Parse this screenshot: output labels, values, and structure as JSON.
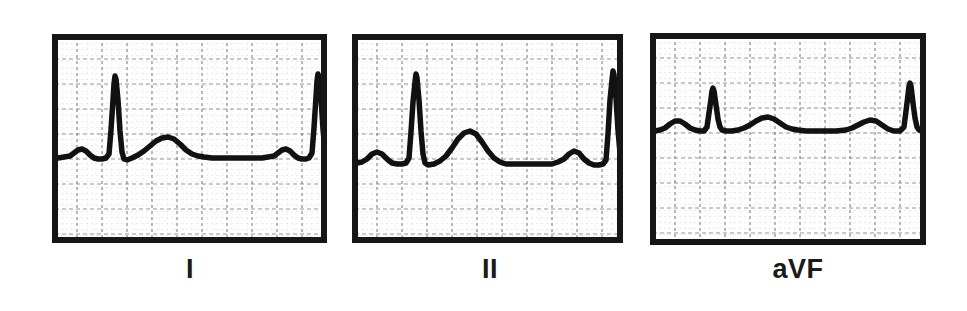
{
  "figure": {
    "kind": "ecg-strip-figure",
    "background_color": "#ffffff",
    "width": 967,
    "height": 311,
    "trace_color": "#111111",
    "frame_color": "#161616",
    "grid_major_color": "#7c7c7c",
    "grid_minor_color": "#bdbdbd",
    "label_color": "#1a1a1a"
  },
  "panels": [
    {
      "id": "lead-i",
      "label": "I",
      "box": {
        "x": 52,
        "y": 34,
        "w": 275,
        "h": 209
      },
      "label_pos": {
        "x": 160,
        "y": 256,
        "w": 60
      },
      "grid": {
        "major_px": 25,
        "minor_px": 5
      },
      "baseline_y": 124,
      "beats": 2,
      "description": "Lead I: low-amplitude P wave, tall narrow R wave, rounded T wave, isoelectric baseline",
      "trace_points": [
        [
          0,
          124
        ],
        [
          6,
          124
        ],
        [
          12,
          123
        ],
        [
          18,
          122
        ],
        [
          22,
          119
        ],
        [
          26,
          116
        ],
        [
          30,
          115
        ],
        [
          34,
          117
        ],
        [
          38,
          121
        ],
        [
          42,
          124
        ],
        [
          46,
          125
        ],
        [
          50,
          125
        ],
        [
          54,
          124
        ],
        [
          57,
          120
        ],
        [
          59,
          96
        ],
        [
          61,
          66
        ],
        [
          62,
          50
        ],
        [
          63,
          42
        ],
        [
          64,
          45
        ],
        [
          66,
          66
        ],
        [
          68,
          97
        ],
        [
          70,
          118
        ],
        [
          72,
          125
        ],
        [
          75,
          126
        ],
        [
          80,
          124
        ],
        [
          86,
          121
        ],
        [
          92,
          117
        ],
        [
          98,
          112
        ],
        [
          104,
          107
        ],
        [
          110,
          104
        ],
        [
          116,
          103
        ],
        [
          122,
          105
        ],
        [
          128,
          110
        ],
        [
          134,
          116
        ],
        [
          140,
          120
        ],
        [
          146,
          122
        ],
        [
          152,
          123
        ],
        [
          160,
          124
        ],
        [
          170,
          124
        ],
        [
          180,
          124
        ],
        [
          190,
          124
        ],
        [
          200,
          124
        ],
        [
          210,
          124
        ],
        [
          216,
          123
        ],
        [
          222,
          122
        ],
        [
          226,
          119
        ],
        [
          230,
          116
        ],
        [
          234,
          115
        ],
        [
          238,
          117
        ],
        [
          242,
          121
        ],
        [
          246,
          124
        ],
        [
          250,
          125
        ],
        [
          254,
          125
        ],
        [
          257,
          124
        ],
        [
          260,
          119
        ],
        [
          262,
          94
        ],
        [
          264,
          63
        ],
        [
          265,
          47
        ],
        [
          266,
          40
        ],
        [
          267,
          43
        ],
        [
          269,
          64
        ],
        [
          271,
          95
        ],
        [
          273,
          117
        ],
        [
          275,
          125
        ],
        [
          278,
          126
        ],
        [
          283,
          124
        ],
        [
          289,
          120
        ],
        [
          295,
          114
        ],
        [
          301,
          107
        ],
        [
          307,
          101
        ],
        [
          313,
          98
        ],
        [
          319,
          99
        ],
        [
          325,
          104
        ],
        [
          331,
          112
        ],
        [
          337,
          118
        ],
        [
          343,
          122
        ],
        [
          349,
          124
        ],
        [
          356,
          125
        ],
        [
          363,
          125
        ]
      ]
    },
    {
      "id": "lead-ii",
      "label": "II",
      "box": {
        "x": 352,
        "y": 34,
        "w": 271,
        "h": 209
      },
      "label_pos": {
        "x": 460,
        "y": 256,
        "w": 60
      },
      "grid": {
        "major_px": 25,
        "minor_px": 5
      },
      "baseline_y": 129,
      "beats": 2,
      "description": "Lead II: upright P wave, tall R wave, prominent rounded T wave",
      "trace_points": [
        [
          0,
          129
        ],
        [
          5,
          129
        ],
        [
          10,
          128
        ],
        [
          15,
          125
        ],
        [
          20,
          120
        ],
        [
          25,
          118
        ],
        [
          30,
          120
        ],
        [
          35,
          125
        ],
        [
          40,
          129
        ],
        [
          45,
          130
        ],
        [
          50,
          130
        ],
        [
          54,
          129
        ],
        [
          57,
          124
        ],
        [
          59,
          98
        ],
        [
          61,
          68
        ],
        [
          63,
          48
        ],
        [
          64,
          40
        ],
        [
          65,
          44
        ],
        [
          67,
          66
        ],
        [
          69,
          97
        ],
        [
          71,
          120
        ],
        [
          73,
          129
        ],
        [
          76,
          131
        ],
        [
          82,
          130
        ],
        [
          88,
          127
        ],
        [
          94,
          122
        ],
        [
          100,
          114
        ],
        [
          106,
          105
        ],
        [
          112,
          99
        ],
        [
          118,
          97
        ],
        [
          124,
          100
        ],
        [
          130,
          108
        ],
        [
          136,
          117
        ],
        [
          142,
          124
        ],
        [
          148,
          128
        ],
        [
          154,
          130
        ],
        [
          162,
          130
        ],
        [
          172,
          130
        ],
        [
          182,
          130
        ],
        [
          192,
          130
        ],
        [
          200,
          130
        ],
        [
          206,
          128
        ],
        [
          212,
          125
        ],
        [
          217,
          120
        ],
        [
          222,
          117
        ],
        [
          227,
          119
        ],
        [
          232,
          125
        ],
        [
          237,
          129
        ],
        [
          242,
          131
        ],
        [
          247,
          131
        ],
        [
          251,
          130
        ],
        [
          254,
          126
        ],
        [
          256,
          100
        ],
        [
          258,
          66
        ],
        [
          260,
          46
        ],
        [
          261,
          37
        ],
        [
          262,
          41
        ],
        [
          264,
          64
        ],
        [
          266,
          96
        ],
        [
          268,
          119
        ],
        [
          270,
          129
        ],
        [
          273,
          131
        ],
        [
          279,
          130
        ],
        [
          285,
          127
        ],
        [
          291,
          121
        ],
        [
          297,
          112
        ],
        [
          303,
          103
        ],
        [
          309,
          97
        ],
        [
          315,
          95
        ],
        [
          321,
          99
        ],
        [
          327,
          108
        ],
        [
          333,
          117
        ],
        [
          339,
          124
        ],
        [
          345,
          128
        ],
        [
          352,
          130
        ],
        [
          360,
          130
        ]
      ]
    },
    {
      "id": "lead-avf",
      "label": "aVF",
      "box": {
        "x": 650,
        "y": 33,
        "w": 276,
        "h": 212
      },
      "label_pos": {
        "x": 758,
        "y": 256,
        "w": 80
      },
      "grid": {
        "major_px": 25,
        "minor_px": 5
      },
      "baseline_y": 96,
      "beats": 2,
      "description": "aVF: small P wave, low-amplitude R wave, low broad T wave, baseline sits high in panel",
      "trace_points": [
        [
          0,
          98
        ],
        [
          5,
          98
        ],
        [
          10,
          97
        ],
        [
          15,
          95
        ],
        [
          20,
          91
        ],
        [
          25,
          88
        ],
        [
          30,
          88
        ],
        [
          35,
          91
        ],
        [
          40,
          95
        ],
        [
          45,
          97
        ],
        [
          50,
          98
        ],
        [
          54,
          98
        ],
        [
          57,
          94
        ],
        [
          59,
          80
        ],
        [
          61,
          66
        ],
        [
          62,
          58
        ],
        [
          63,
          55
        ],
        [
          64,
          58
        ],
        [
          66,
          72
        ],
        [
          68,
          86
        ],
        [
          70,
          94
        ],
        [
          72,
          97
        ],
        [
          76,
          98
        ],
        [
          82,
          98
        ],
        [
          88,
          97
        ],
        [
          94,
          95
        ],
        [
          100,
          92
        ],
        [
          106,
          88
        ],
        [
          112,
          85
        ],
        [
          118,
          84
        ],
        [
          124,
          86
        ],
        [
          130,
          90
        ],
        [
          136,
          94
        ],
        [
          142,
          96
        ],
        [
          148,
          97
        ],
        [
          156,
          98
        ],
        [
          166,
          98
        ],
        [
          176,
          98
        ],
        [
          186,
          98
        ],
        [
          196,
          97
        ],
        [
          202,
          95
        ],
        [
          208,
          92
        ],
        [
          214,
          89
        ],
        [
          220,
          87
        ],
        [
          226,
          88
        ],
        [
          232,
          92
        ],
        [
          238,
          96
        ],
        [
          244,
          98
        ],
        [
          250,
          98
        ],
        [
          254,
          94
        ],
        [
          256,
          78
        ],
        [
          258,
          62
        ],
        [
          259,
          53
        ],
        [
          260,
          50
        ],
        [
          261,
          53
        ],
        [
          263,
          70
        ],
        [
          265,
          85
        ],
        [
          267,
          94
        ],
        [
          269,
          97
        ],
        [
          273,
          98
        ],
        [
          279,
          98
        ],
        [
          285,
          97
        ],
        [
          291,
          95
        ],
        [
          297,
          92
        ],
        [
          303,
          88
        ],
        [
          309,
          85
        ],
        [
          315,
          84
        ],
        [
          321,
          86
        ],
        [
          327,
          91
        ],
        [
          333,
          95
        ],
        [
          339,
          97
        ],
        [
          346,
          98
        ],
        [
          355,
          98
        ],
        [
          364,
          98
        ]
      ]
    }
  ]
}
